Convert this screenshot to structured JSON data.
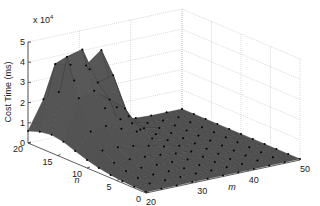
{
  "chart_data": {
    "type": "surface3d",
    "title": "",
    "xlabel": "m",
    "ylabel": "n",
    "zlabel": "Cost Time (ms)",
    "z_exponent_label": "x 10",
    "z_exponent": "4",
    "x_ticks": [
      20,
      30,
      40,
      50
    ],
    "y_ticks": [
      0,
      5,
      10,
      15,
      20
    ],
    "z_ticks": [
      0,
      1,
      2,
      3,
      4,
      5
    ],
    "xlim": [
      20,
      50
    ],
    "ylim": [
      0,
      20
    ],
    "zlim": [
      0,
      50000
    ],
    "grid": true,
    "surface_color": "#555555",
    "edge_color": "#3a3a3a",
    "marker_color": "#000000",
    "x": [
      20,
      23,
      26,
      29,
      32,
      35,
      38,
      41,
      44,
      47,
      50
    ],
    "y": [
      0,
      2,
      4,
      6,
      8,
      10,
      12,
      14,
      16,
      18,
      20
    ],
    "z_note": "z[i][j] = cost time at y[i], x[j]; two peaks near (m≈23,n≈16) ~48000 and (m≈29,n≈18) ~42000",
    "z": [
      [
        500,
        500,
        500,
        500,
        500,
        500,
        500,
        500,
        500,
        500,
        500
      ],
      [
        600,
        600,
        600,
        600,
        600,
        500,
        500,
        500,
        500,
        500,
        500
      ],
      [
        900,
        900,
        900,
        900,
        800,
        700,
        600,
        500,
        500,
        500,
        500
      ],
      [
        1500,
        1800,
        1800,
        1700,
        1400,
        1000,
        700,
        600,
        500,
        500,
        500
      ],
      [
        2500,
        3500,
        3500,
        3200,
        2500,
        1500,
        900,
        600,
        500,
        500,
        500
      ],
      [
        4000,
        7000,
        7000,
        6000,
        4500,
        2500,
        1200,
        700,
        500,
        500,
        500
      ],
      [
        6000,
        14000,
        15000,
        12000,
        9000,
        4000,
        1500,
        800,
        500,
        500,
        500
      ],
      [
        8000,
        28000,
        30000,
        24000,
        18000,
        6000,
        2000,
        900,
        500,
        500,
        500
      ],
      [
        9000,
        46000,
        48000,
        30000,
        32000,
        10000,
        2500,
        1000,
        500,
        500,
        500
      ],
      [
        8000,
        40000,
        38000,
        36000,
        42000,
        12000,
        2500,
        1000,
        500,
        500,
        500
      ],
      [
        6000,
        20000,
        22000,
        26000,
        30000,
        9000,
        2000,
        900,
        500,
        500,
        500
      ]
    ]
  }
}
